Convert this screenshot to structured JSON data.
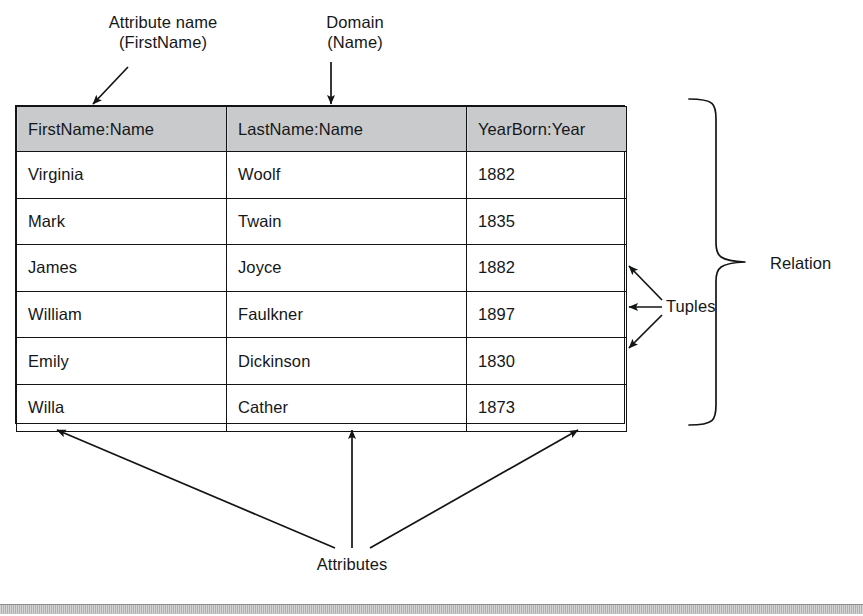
{
  "figure": {
    "line_color": "#121416",
    "text_color": "#15171a",
    "header_fill": "#aaabac",
    "page_background": "#ffffff",
    "bottom_rule_color": "#b0b1b2"
  },
  "annotations": {
    "attribute_name": {
      "line1": "Attribute name",
      "line2": "(FirstName)"
    },
    "domain": {
      "line1": "Domain",
      "line2": "(Name)"
    },
    "relation": "Relation",
    "tuples": "Tuples",
    "attributes": "Attributes"
  },
  "table": {
    "columns": [
      {
        "attribute": "FirstName",
        "domain": "Name",
        "header": "FirstName:Name"
      },
      {
        "attribute": "LastName",
        "domain": "Name",
        "header": "LastName:Name"
      },
      {
        "attribute": "YearBorn",
        "domain": "Year",
        "header": "YearBorn:Year"
      }
    ],
    "rows": [
      {
        "FirstName": "Virginia",
        "LastName": "Woolf",
        "YearBorn": "1882"
      },
      {
        "FirstName": "Mark",
        "LastName": "Twain",
        "YearBorn": "1835"
      },
      {
        "FirstName": "James",
        "LastName": "Joyce",
        "YearBorn": "1882"
      },
      {
        "FirstName": "William",
        "LastName": "Faulkner",
        "YearBorn": "1897"
      },
      {
        "FirstName": "Emily",
        "LastName": "Dickinson",
        "YearBorn": "1830"
      },
      {
        "FirstName": "Willa",
        "LastName": "Cather",
        "YearBorn": "1873"
      }
    ]
  }
}
